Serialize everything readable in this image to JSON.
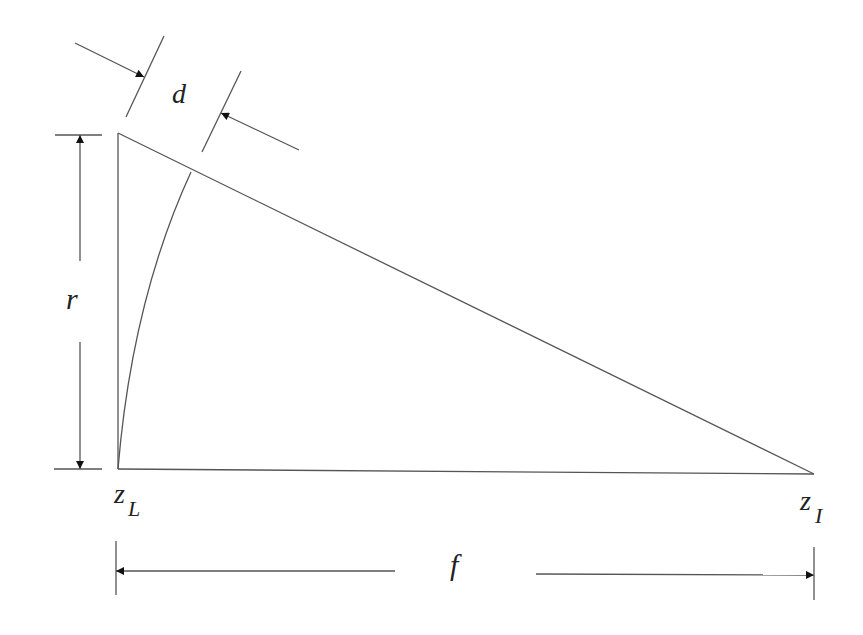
{
  "diagram": {
    "labels": {
      "d": "d",
      "r": "r",
      "f": "f",
      "zL_main": "z",
      "zL_sub": "L",
      "zI_main": "z",
      "zI_sub": "I"
    },
    "colors": {
      "line": "#555555",
      "text": "#222222",
      "background": "#ffffff"
    }
  }
}
